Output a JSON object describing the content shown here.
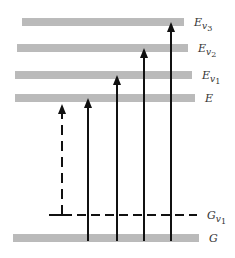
{
  "diagram": {
    "type": "energy-level-diagram",
    "levels": [
      {
        "id": "Ev3",
        "label": "E",
        "sub": "v",
        "subsub": "3",
        "y": 22,
        "x1": 22,
        "x2": 184,
        "style": "band"
      },
      {
        "id": "Ev2",
        "label": "E",
        "sub": "v",
        "subsub": "2",
        "y": 48,
        "x1": 17,
        "x2": 188,
        "style": "band"
      },
      {
        "id": "Ev1",
        "label": "E",
        "sub": "v",
        "subsub": "1",
        "y": 75,
        "x1": 15,
        "x2": 192,
        "style": "band"
      },
      {
        "id": "E",
        "label": "E",
        "sub": "",
        "subsub": "",
        "y": 98,
        "x1": 15,
        "x2": 195,
        "style": "band"
      },
      {
        "id": "Gv1",
        "label": "G",
        "sub": "v",
        "subsub": "1",
        "y": 215,
        "x1": 49,
        "x2": 197,
        "style": "dashed"
      },
      {
        "id": "G",
        "label": "G",
        "sub": "",
        "subsub": "",
        "y": 238,
        "x1": 13,
        "x2": 199,
        "style": "band"
      }
    ],
    "transitions": [
      {
        "from": "Gv1",
        "to": "E",
        "x": 62,
        "style": "dashed"
      },
      {
        "from": "G",
        "to": "E",
        "x": 88,
        "style": "solid"
      },
      {
        "from": "G",
        "to": "Ev1",
        "x": 117,
        "style": "solid"
      },
      {
        "from": "G",
        "to": "Ev2",
        "x": 144,
        "style": "solid"
      },
      {
        "from": "G",
        "to": "Ev3",
        "x": 171,
        "style": "solid"
      }
    ],
    "colors": {
      "line": "#111111",
      "band": "#777777",
      "label": "#333333"
    }
  }
}
